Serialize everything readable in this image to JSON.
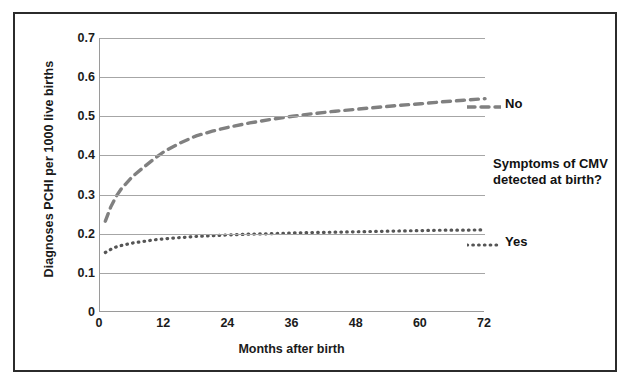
{
  "chart_data": {
    "type": "line",
    "title": "",
    "subtitle": "",
    "xlabel": "Months after birth",
    "ylabel": "Diagnoses PCHI per 1000 live births",
    "xlim": [
      0,
      72
    ],
    "ylim": [
      0,
      0.7
    ],
    "xticks": [
      "0",
      "12",
      "24",
      "36",
      "48",
      "60",
      "72"
    ],
    "xtick_values": [
      0,
      12,
      24,
      36,
      48,
      60,
      72
    ],
    "yticks": [
      "0",
      "0.1",
      "0.2",
      "0.3",
      "0.4",
      "0.5",
      "0.6",
      "0.7"
    ],
    "ytick_values": [
      0,
      0.1,
      0.2,
      0.3,
      0.4,
      0.5,
      0.6,
      0.7
    ],
    "grid": "horizontal",
    "legend_position": "right-inline",
    "legend_title": "Symptoms of CMV detected at birth?",
    "annotations": [
      "Symptoms of CMV detected at birth?"
    ],
    "series": [
      {
        "name": "No",
        "linestyle": "dashed",
        "color": "#808080",
        "x": [
          1,
          2,
          3,
          4,
          6,
          8,
          10,
          12,
          15,
          18,
          21,
          24,
          28,
          32,
          36,
          40,
          44,
          48,
          52,
          56,
          60,
          64,
          68,
          72
        ],
        "values": [
          0.232,
          0.268,
          0.295,
          0.315,
          0.345,
          0.368,
          0.39,
          0.41,
          0.432,
          0.45,
          0.462,
          0.472,
          0.483,
          0.492,
          0.5,
          0.507,
          0.513,
          0.518,
          0.523,
          0.528,
          0.532,
          0.537,
          0.541,
          0.545
        ]
      },
      {
        "name": "Yes",
        "linestyle": "dotted",
        "color": "#555555",
        "x": [
          1,
          2,
          3,
          4,
          6,
          8,
          10,
          12,
          15,
          18,
          21,
          24,
          28,
          32,
          36,
          40,
          44,
          48,
          52,
          56,
          60,
          64,
          68,
          72
        ],
        "values": [
          0.152,
          0.16,
          0.166,
          0.17,
          0.176,
          0.18,
          0.184,
          0.187,
          0.19,
          0.193,
          0.195,
          0.197,
          0.199,
          0.2,
          0.202,
          0.203,
          0.204,
          0.205,
          0.206,
          0.207,
          0.208,
          0.209,
          0.209,
          0.21
        ]
      }
    ]
  },
  "axes": {
    "y_title": "Diagnoses PCHI per 1000 live births",
    "x_title": "Months after birth"
  },
  "legend": {
    "no_label": "No",
    "yes_label": "Yes",
    "question": "Symptoms of CMV detected at birth?"
  },
  "colors": {
    "grid": "#a6a6a6",
    "axis": "#9a9a9a",
    "series_no": "#808080",
    "series_yes": "#555555",
    "frame": "#2b2b2b",
    "text": "#1b1b1b"
  }
}
